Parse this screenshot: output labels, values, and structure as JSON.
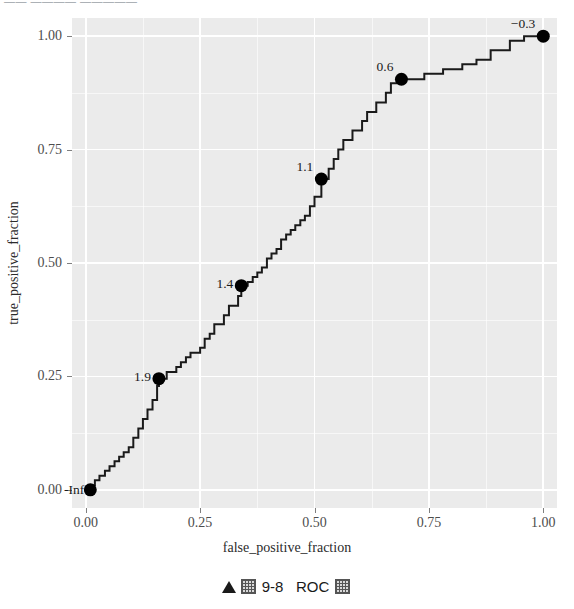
{
  "header": {
    "clipped_text": "—— ———— —————"
  },
  "caption": {
    "marker": "triangle-up",
    "prefix_box": "▦",
    "number": "9-8",
    "title": "ROC",
    "suffix_box": "▦",
    "full_text": "▲ ▦ 9-8  ROC ▦"
  },
  "chart_data": {
    "type": "line",
    "subtype": "step",
    "title": "",
    "xlabel": "false_positive_fraction",
    "ylabel": "true_positive_fraction",
    "xlim": [
      -0.03,
      1.03
    ],
    "ylim": [
      -0.04,
      1.04
    ],
    "grid": true,
    "legend": "none",
    "panel_background": "#ebebeb",
    "grid_color": "#ffffff",
    "line_color": "#1a1a1a",
    "point_color": "#000000",
    "xticks": [
      0.0,
      0.25,
      0.5,
      0.75,
      1.0
    ],
    "xticklabels": [
      "0.00",
      "0.25",
      "0.50",
      "0.75",
      "1.00"
    ],
    "yticks": [
      0.0,
      0.25,
      0.5,
      0.75,
      1.0
    ],
    "yticklabels": [
      "0.00",
      "0.25",
      "0.50",
      "0.75",
      "1.00"
    ],
    "series": [
      {
        "name": "ROC",
        "x": [
          0.01,
          0.01,
          0.02,
          0.02,
          0.03,
          0.03,
          0.042,
          0.042,
          0.052,
          0.052,
          0.063,
          0.063,
          0.073,
          0.073,
          0.083,
          0.083,
          0.094,
          0.094,
          0.104,
          0.104,
          0.115,
          0.115,
          0.125,
          0.125,
          0.135,
          0.135,
          0.146,
          0.146,
          0.156,
          0.156,
          0.16,
          0.16,
          0.177,
          0.177,
          0.198,
          0.198,
          0.208,
          0.208,
          0.219,
          0.219,
          0.229,
          0.229,
          0.25,
          0.25,
          0.26,
          0.26,
          0.271,
          0.271,
          0.281,
          0.281,
          0.302,
          0.302,
          0.313,
          0.313,
          0.333,
          0.333,
          0.34,
          0.34,
          0.354,
          0.354,
          0.365,
          0.365,
          0.375,
          0.375,
          0.385,
          0.385,
          0.396,
          0.396,
          0.406,
          0.406,
          0.417,
          0.417,
          0.427,
          0.427,
          0.438,
          0.438,
          0.448,
          0.448,
          0.458,
          0.458,
          0.469,
          0.469,
          0.479,
          0.479,
          0.49,
          0.49,
          0.5,
          0.5,
          0.515,
          0.515,
          0.531,
          0.531,
          0.542,
          0.542,
          0.552,
          0.552,
          0.563,
          0.563,
          0.583,
          0.583,
          0.604,
          0.604,
          0.615,
          0.615,
          0.635,
          0.635,
          0.656,
          0.656,
          0.667,
          0.667,
          0.69,
          0.69,
          0.74,
          0.74,
          0.781,
          0.781,
          0.823,
          0.823,
          0.854,
          0.854,
          0.885,
          0.885,
          0.927,
          0.927,
          0.958,
          0.958,
          1.0
        ],
        "y": [
          0.0,
          0.01,
          0.01,
          0.021,
          0.021,
          0.031,
          0.031,
          0.042,
          0.042,
          0.052,
          0.052,
          0.063,
          0.063,
          0.073,
          0.073,
          0.083,
          0.083,
          0.094,
          0.094,
          0.115,
          0.115,
          0.135,
          0.135,
          0.156,
          0.156,
          0.177,
          0.177,
          0.198,
          0.198,
          0.229,
          0.229,
          0.245,
          0.245,
          0.26,
          0.26,
          0.271,
          0.271,
          0.281,
          0.281,
          0.292,
          0.292,
          0.302,
          0.302,
          0.313,
          0.313,
          0.333,
          0.333,
          0.344,
          0.344,
          0.365,
          0.365,
          0.385,
          0.385,
          0.406,
          0.406,
          0.427,
          0.427,
          0.45,
          0.45,
          0.458,
          0.458,
          0.469,
          0.469,
          0.479,
          0.479,
          0.49,
          0.49,
          0.51,
          0.51,
          0.521,
          0.521,
          0.531,
          0.531,
          0.552,
          0.552,
          0.563,
          0.563,
          0.573,
          0.573,
          0.583,
          0.583,
          0.594,
          0.594,
          0.604,
          0.604,
          0.625,
          0.625,
          0.646,
          0.646,
          0.685,
          0.685,
          0.708,
          0.708,
          0.729,
          0.729,
          0.75,
          0.75,
          0.771,
          0.771,
          0.792,
          0.792,
          0.813,
          0.813,
          0.833,
          0.833,
          0.854,
          0.854,
          0.875,
          0.875,
          0.896,
          0.896,
          0.905,
          0.905,
          0.917,
          0.917,
          0.927,
          0.927,
          0.938,
          0.938,
          0.948,
          0.948,
          0.969,
          0.969,
          0.99,
          0.99,
          1.0,
          1.0
        ]
      }
    ],
    "annotated_points": [
      {
        "label": "-Inf",
        "x": 0.01,
        "y": 0.0,
        "label_dx": -6,
        "label_dy": 0
      },
      {
        "label": "1.9",
        "x": 0.16,
        "y": 0.245,
        "label_dx": -8,
        "label_dy": -2
      },
      {
        "label": "1.4",
        "x": 0.34,
        "y": 0.45,
        "label_dx": -8,
        "label_dy": -2
      },
      {
        "label": "1.1",
        "x": 0.515,
        "y": 0.685,
        "label_dx": -8,
        "label_dy": -12
      },
      {
        "label": "0.6",
        "x": 0.69,
        "y": 0.905,
        "label_dx": -8,
        "label_dy": -12
      },
      {
        "label": "−0.3",
        "x": 1.0,
        "y": 1.0,
        "label_dx": -8,
        "label_dy": -12
      }
    ]
  }
}
